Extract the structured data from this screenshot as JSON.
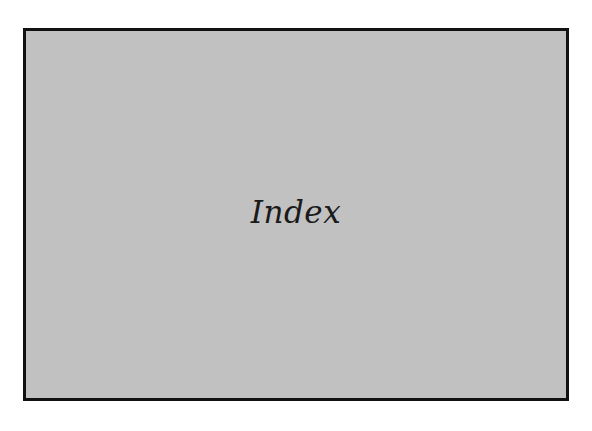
{
  "panel": {
    "title": "Index",
    "background_color": "#c1c1c1",
    "border_color": "#111111"
  }
}
